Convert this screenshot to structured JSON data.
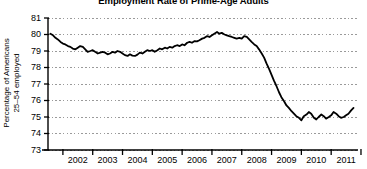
{
  "chart_data": {
    "type": "line",
    "title": "Employment Rate of Prime-Age Adults",
    "xlabel": "",
    "ylabel_line1": "Percentage of Americans",
    "ylabel_line2": "25–54 employed",
    "ylim": [
      73,
      81
    ],
    "yticks": [
      73,
      74,
      75,
      76,
      77,
      78,
      79,
      80,
      81
    ],
    "ytick_labels": [
      "73",
      "74",
      "75",
      "76",
      "77",
      "78",
      "79",
      "80",
      "81"
    ],
    "xlim": [
      2001.5,
      2011.9
    ],
    "xticks": [
      2002,
      2003,
      2004,
      2005,
      2006,
      2007,
      2008,
      2009,
      2010,
      2011
    ],
    "xtick_labels": [
      "2002",
      "2003",
      "2004",
      "2005",
      "2006",
      "2007",
      "2008",
      "2009",
      "2010",
      "2011"
    ],
    "grid": true,
    "grid_style": "dotted",
    "grid_color": "#9a9a9a",
    "legend": "none",
    "line_color": "#000000",
    "line_width": 1.8,
    "series": [
      {
        "name": "Employment rate, ages 25–54",
        "x": [
          2001.58,
          2001.67,
          2001.75,
          2001.83,
          2001.92,
          2002.0,
          2002.08,
          2002.17,
          2002.25,
          2002.33,
          2002.42,
          2002.5,
          2002.58,
          2002.67,
          2002.75,
          2002.83,
          2002.92,
          2003.0,
          2003.08,
          2003.17,
          2003.25,
          2003.33,
          2003.42,
          2003.5,
          2003.58,
          2003.67,
          2003.75,
          2003.83,
          2003.92,
          2004.0,
          2004.08,
          2004.17,
          2004.25,
          2004.33,
          2004.42,
          2004.5,
          2004.58,
          2004.67,
          2004.75,
          2004.83,
          2004.92,
          2005.0,
          2005.08,
          2005.17,
          2005.25,
          2005.33,
          2005.42,
          2005.5,
          2005.58,
          2005.67,
          2005.75,
          2005.83,
          2005.92,
          2006.0,
          2006.08,
          2006.17,
          2006.25,
          2006.33,
          2006.42,
          2006.5,
          2006.58,
          2006.67,
          2006.75,
          2006.83,
          2006.92,
          2007.0,
          2007.08,
          2007.17,
          2007.25,
          2007.33,
          2007.42,
          2007.5,
          2007.58,
          2007.67,
          2007.75,
          2007.83,
          2007.92,
          2008.0,
          2008.08,
          2008.17,
          2008.25,
          2008.33,
          2008.42,
          2008.5,
          2008.58,
          2008.67,
          2008.75,
          2008.83,
          2008.92,
          2009.0,
          2009.08,
          2009.17,
          2009.25,
          2009.33,
          2009.42,
          2009.5,
          2009.58,
          2009.67,
          2009.75,
          2009.83,
          2009.92,
          2010.0,
          2010.08,
          2010.17,
          2010.25,
          2010.33,
          2010.42,
          2010.5,
          2010.58,
          2010.67,
          2010.75,
          2010.83,
          2010.92,
          2011.0,
          2011.08,
          2011.17,
          2011.25,
          2011.33,
          2011.42,
          2011.5,
          2011.58,
          2011.67,
          2011.75
        ],
        "values": [
          80.05,
          79.95,
          79.8,
          79.7,
          79.55,
          79.45,
          79.4,
          79.3,
          79.25,
          79.15,
          79.1,
          79.2,
          79.3,
          79.25,
          79.1,
          78.95,
          79.0,
          79.05,
          78.95,
          78.85,
          78.9,
          78.95,
          78.9,
          78.8,
          78.85,
          78.95,
          78.9,
          79.0,
          78.95,
          78.85,
          78.75,
          78.7,
          78.8,
          78.72,
          78.7,
          78.78,
          78.9,
          78.85,
          78.95,
          79.05,
          79.0,
          79.05,
          78.95,
          79.05,
          79.15,
          79.1,
          79.2,
          79.15,
          79.25,
          79.2,
          79.3,
          79.35,
          79.3,
          79.4,
          79.35,
          79.5,
          79.55,
          79.5,
          79.6,
          79.58,
          79.65,
          79.75,
          79.8,
          79.9,
          79.85,
          79.95,
          80.05,
          80.15,
          80.05,
          80.1,
          80.0,
          79.95,
          79.9,
          79.85,
          79.8,
          79.75,
          79.8,
          79.75,
          79.9,
          79.85,
          79.7,
          79.55,
          79.4,
          79.3,
          79.1,
          78.85,
          78.6,
          78.25,
          77.9,
          77.55,
          77.2,
          76.85,
          76.5,
          76.2,
          75.95,
          75.7,
          75.55,
          75.35,
          75.2,
          75.05,
          74.95,
          74.8,
          75.05,
          75.15,
          75.3,
          75.2,
          74.95,
          74.85,
          75.0,
          75.15,
          75.05,
          74.9,
          75.0,
          75.1,
          75.3,
          75.2,
          75.05,
          74.95,
          75.0,
          75.1,
          75.2,
          75.4,
          75.55
        ]
      }
    ]
  }
}
